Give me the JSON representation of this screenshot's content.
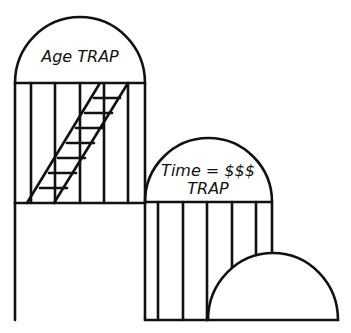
{
  "diagram": {
    "type": "cartoon-diagram",
    "colors": {
      "stroke": "#111111",
      "background": "#ffffff"
    },
    "structures": [
      {
        "id": "age-trap",
        "shape": "arched-cage-tower",
        "label": "Age TRAP",
        "contains": "ladder"
      },
      {
        "id": "time-money-trap",
        "shape": "arched-cage-tower",
        "label_line1": "Time = $$$",
        "label_line2": "TRAP"
      },
      {
        "id": "dome",
        "shape": "semicircular-dome"
      }
    ]
  }
}
